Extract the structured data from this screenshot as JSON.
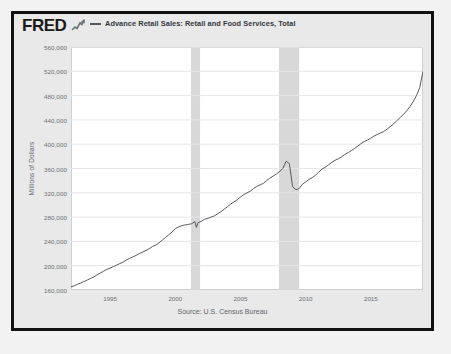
{
  "branding": {
    "logo_text": "FRED",
    "logo_mark_icon": "line-chart-icon"
  },
  "legend": {
    "entries": [
      {
        "label": "Advance Retail Sales: Retail and Food Services, Total",
        "color": "#555a5f"
      }
    ]
  },
  "source": {
    "text": "Source: U.S. Census Bureau"
  },
  "chart_data": {
    "type": "line",
    "title": "",
    "subtitle": "",
    "xlabel": "",
    "ylabel": "Millions of Dollars",
    "xlim": [
      1992.0,
      2019.0
    ],
    "ylim": [
      160000,
      560000
    ],
    "grid": true,
    "legend_position": "top",
    "line_color": "#555a5f",
    "xticks": [
      1995,
      2000,
      2005,
      2010,
      2015
    ],
    "xtick_labels": [
      "1995",
      "2000",
      "2005",
      "2010",
      "2015"
    ],
    "yticks": [
      160000,
      200000,
      240000,
      280000,
      320000,
      360000,
      400000,
      440000,
      480000,
      520000,
      560000
    ],
    "ytick_labels": [
      "160,000",
      "200,000",
      "240,000",
      "280,000",
      "320,000",
      "360,000",
      "400,000",
      "440,000",
      "480,000",
      "520,000",
      "560,000"
    ],
    "recession_bands": [
      {
        "start": 2001.2,
        "end": 2001.9,
        "color": "#d8d8d8"
      },
      {
        "start": 2007.95,
        "end": 2009.5,
        "color": "#d8d8d8"
      }
    ],
    "series": [
      {
        "name": "Advance Retail Sales: Retail and Food Services, Total",
        "x": [
          1992.0,
          1992.25,
          1992.5,
          1992.75,
          1993.0,
          1993.25,
          1993.5,
          1993.75,
          1994.0,
          1994.25,
          1994.5,
          1994.75,
          1995.0,
          1995.25,
          1995.5,
          1995.75,
          1996.0,
          1996.25,
          1996.5,
          1996.75,
          1997.0,
          1997.25,
          1997.5,
          1997.75,
          1998.0,
          1998.25,
          1998.5,
          1998.75,
          1999.0,
          1999.25,
          1999.5,
          1999.75,
          2000.0,
          2000.25,
          2000.5,
          2000.75,
          2001.0,
          2001.25,
          2001.5,
          2001.62,
          2001.75,
          2002.0,
          2002.25,
          2002.5,
          2002.75,
          2003.0,
          2003.25,
          2003.5,
          2003.75,
          2004.0,
          2004.25,
          2004.5,
          2004.75,
          2005.0,
          2005.25,
          2005.5,
          2005.75,
          2006.0,
          2006.25,
          2006.5,
          2006.75,
          2007.0,
          2007.25,
          2007.5,
          2007.75,
          2008.0,
          2008.25,
          2008.5,
          2008.75,
          2009.0,
          2009.25,
          2009.5,
          2009.75,
          2010.0,
          2010.25,
          2010.5,
          2010.75,
          2011.0,
          2011.25,
          2011.5,
          2011.75,
          2012.0,
          2012.25,
          2012.5,
          2012.75,
          2013.0,
          2013.25,
          2013.5,
          2013.75,
          2014.0,
          2014.25,
          2014.5,
          2014.75,
          2015.0,
          2015.25,
          2015.5,
          2015.75,
          2016.0,
          2016.25,
          2016.5,
          2016.75,
          2017.0,
          2017.25,
          2017.5,
          2017.75,
          2018.0,
          2018.25,
          2018.5,
          2018.75,
          2019.0
        ],
        "y": [
          165000,
          167000,
          169500,
          171500,
          174000,
          176500,
          179000,
          181500,
          185000,
          188000,
          191000,
          194000,
          196000,
          198500,
          201000,
          203500,
          206000,
          209500,
          212000,
          214500,
          217000,
          220000,
          222500,
          225000,
          228000,
          231500,
          234000,
          237500,
          242000,
          246500,
          251000,
          255500,
          261000,
          264000,
          266000,
          267000,
          268000,
          269000,
          272500,
          263000,
          271000,
          273000,
          276500,
          278000,
          280000,
          282000,
          285500,
          289000,
          293000,
          297000,
          301500,
          305000,
          308500,
          313000,
          317000,
          320000,
          322500,
          327000,
          330500,
          333000,
          335500,
          340000,
          344000,
          347500,
          351000,
          355000,
          360000,
          372000,
          368000,
          330000,
          325000,
          327000,
          334000,
          338000,
          342000,
          345000,
          349000,
          354000,
          359000,
          362000,
          366000,
          370000,
          373500,
          376000,
          379000,
          383000,
          386000,
          389500,
          393000,
          397000,
          401000,
          404500,
          407000,
          410000,
          413500,
          416000,
          418500,
          421000,
          425000,
          429000,
          433500,
          439000,
          444000,
          449000,
          455000,
          462000,
          470000,
          480000,
          493000,
          520000
        ]
      }
    ],
    "annotations": []
  }
}
